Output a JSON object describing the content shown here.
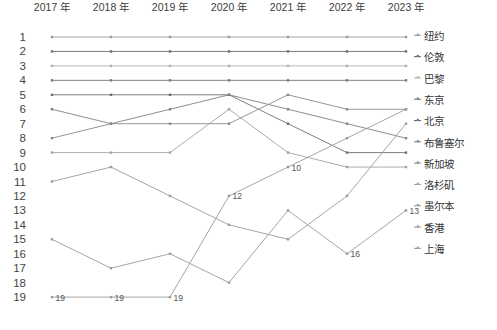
{
  "chart_data": {
    "type": "line",
    "title": "",
    "xlabel": "",
    "ylabel": "",
    "categories": [
      "2017 年",
      "2018 年",
      "2019 年",
      "2020 年",
      "2021 年",
      "2022 年",
      "2023 年"
    ],
    "ylim": [
      1,
      19
    ],
    "y_inverted": true,
    "yticks": [
      1,
      2,
      3,
      4,
      5,
      6,
      7,
      8,
      9,
      10,
      11,
      12,
      13,
      14,
      15,
      16,
      17,
      18,
      19
    ],
    "grid": false,
    "legend_position": "right",
    "series": [
      {
        "name": "纽约",
        "values": [
          1,
          1,
          1,
          1,
          1,
          1,
          1
        ],
        "color": "#9a9a9a"
      },
      {
        "name": "伦敦",
        "values": [
          2,
          2,
          2,
          2,
          2,
          2,
          2
        ],
        "color": "#6e6e6e"
      },
      {
        "name": "巴黎",
        "values": [
          3,
          3,
          3,
          3,
          3,
          3,
          3
        ],
        "color": "#b0b0b0"
      },
      {
        "name": "东京",
        "values": [
          4,
          4,
          4,
          4,
          4,
          4,
          4
        ],
        "color": "#777777"
      },
      {
        "name": "北京",
        "values": [
          5,
          5,
          5,
          5,
          7,
          9,
          9
        ],
        "color": "#6f6f6f"
      },
      {
        "name": "布鲁塞尔",
        "values": [
          6,
          7,
          6,
          5,
          6,
          7,
          8
        ],
        "color": "#828282"
      },
      {
        "name": "新加坡",
        "values": [
          8,
          7,
          7,
          7,
          5,
          6,
          6
        ],
        "color": "#8a8a8a"
      },
      {
        "name": "洛杉矶",
        "values": [
          9,
          9,
          9,
          6,
          9,
          10,
          10
        ],
        "color": "#a3a3a3"
      },
      {
        "name": "墨尔本",
        "values": [
          11,
          10,
          12,
          14,
          15,
          12,
          7
        ],
        "color": "#9b9b9b"
      },
      {
        "name": "香港",
        "values": [
          15,
          17,
          16,
          18,
          13,
          16,
          13
        ],
        "color": "#9b9b9b"
      },
      {
        "name": "上海",
        "values": [
          19,
          19,
          19,
          12,
          10,
          8,
          6
        ],
        "color": "#9b9b9b"
      }
    ],
    "data_labels": [
      {
        "text": "19",
        "series": "上海",
        "x_index": 0,
        "value": 19
      },
      {
        "text": "19",
        "series": "上海",
        "x_index": 1,
        "value": 19
      },
      {
        "text": "19",
        "series": "上海",
        "x_index": 2,
        "value": 19
      },
      {
        "text": "12",
        "series": "上海",
        "x_index": 3,
        "value": 12
      },
      {
        "text": "10",
        "series": "上海",
        "x_index": 4,
        "value": 10
      },
      {
        "text": "16",
        "series": "香港",
        "x_index": 5,
        "value": 16
      },
      {
        "text": "13",
        "series": "香港",
        "x_index": 6,
        "value": 13
      }
    ]
  },
  "legend": {
    "items": [
      {
        "label": "纽约"
      },
      {
        "label": "伦敦"
      },
      {
        "label": "巴黎"
      },
      {
        "label": "东京"
      },
      {
        "label": "北京"
      },
      {
        "label": "布鲁塞尔"
      },
      {
        "label": "新加坡"
      },
      {
        "label": "洛杉矶"
      },
      {
        "label": "墨尔本"
      },
      {
        "label": "香港"
      },
      {
        "label": "上海"
      }
    ]
  }
}
